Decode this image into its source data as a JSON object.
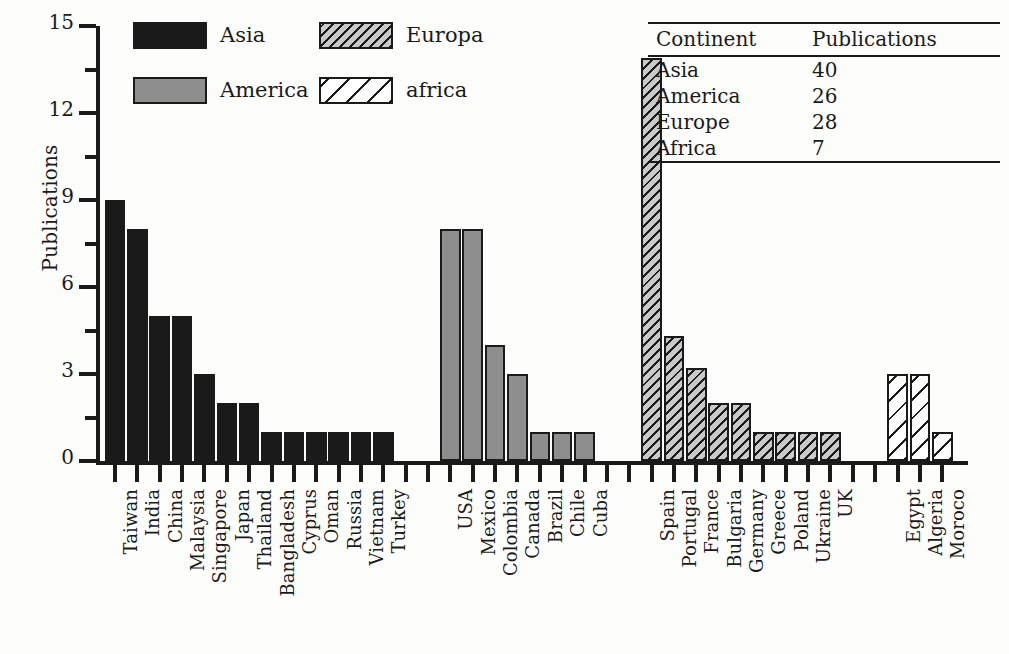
{
  "chart_data": {
    "type": "bar",
    "title": "",
    "xlabel": "",
    "ylabel": "Publications",
    "ylim": [
      0,
      15
    ],
    "ytick_values": [
      0,
      3,
      6,
      9,
      12,
      15
    ],
    "ytick_labels": [
      "0",
      "3",
      "6",
      "9",
      "12",
      "15"
    ],
    "y_minor_tick_values": [
      1.5,
      4.5,
      7.5,
      10.5,
      13.5
    ],
    "grid": false,
    "legend_position": "top-left",
    "groups": [
      {
        "name": "Asia",
        "legend_label": "Asia",
        "fill": "solid-black",
        "color": "#1a1a1a",
        "categories": [
          "Taiwan",
          "India",
          "China",
          "Malaysia",
          "Singapore",
          "Japan",
          "Thailand",
          "Bangladesh",
          "Cyprus",
          "Oman",
          "Russia",
          "Vietnam",
          "Turkey"
        ],
        "values": [
          9,
          8,
          5,
          5,
          3,
          2,
          2,
          1,
          1,
          1,
          1,
          1,
          1
        ],
        "total": 40
      },
      {
        "name": "America",
        "legend_label": "America",
        "fill": "solid-gray",
        "color": "#8e8e8e",
        "categories": [
          "USA",
          "Mexico",
          "Colombia",
          "Canada",
          "Brazil",
          "Chile",
          "Cuba"
        ],
        "values": [
          8,
          8,
          4,
          3,
          1,
          1,
          1
        ],
        "total": 26
      },
      {
        "name": "Europe",
        "legend_label": "Europa",
        "fill": "dense-hatch-gray",
        "color": "#c9c9c9",
        "categories": [
          "Spain",
          "Portugal",
          "France",
          "Bulgaria",
          "Germany",
          "Greece",
          "Poland",
          "Ukraine",
          "UK"
        ],
        "values": [
          13.9,
          4.3,
          3.2,
          2,
          2,
          1,
          1,
          1,
          1
        ],
        "total": 28
      },
      {
        "name": "Africa",
        "legend_label": "africa",
        "fill": "sparse-hatch-white",
        "color": "#ffffff",
        "categories": [
          "Egypt",
          "Algeria",
          "Moroco"
        ],
        "values": [
          3,
          3,
          1
        ],
        "total": 7
      }
    ]
  },
  "legend": {
    "items": [
      {
        "label": "Asia",
        "style": "asia"
      },
      {
        "label": "America",
        "style": "america"
      },
      {
        "label": "Europa",
        "style": "europe"
      },
      {
        "label": "africa",
        "style": "africa"
      }
    ]
  },
  "inset_table": {
    "headers": [
      "Continent",
      "Publications"
    ],
    "rows": [
      {
        "continent": "Asia",
        "publications": "40"
      },
      {
        "continent": "America",
        "publications": "26"
      },
      {
        "continent": "Europe",
        "publications": "28"
      },
      {
        "continent": "Africa",
        "publications": "7"
      }
    ]
  },
  "axes": {
    "y_label": "Publications"
  }
}
